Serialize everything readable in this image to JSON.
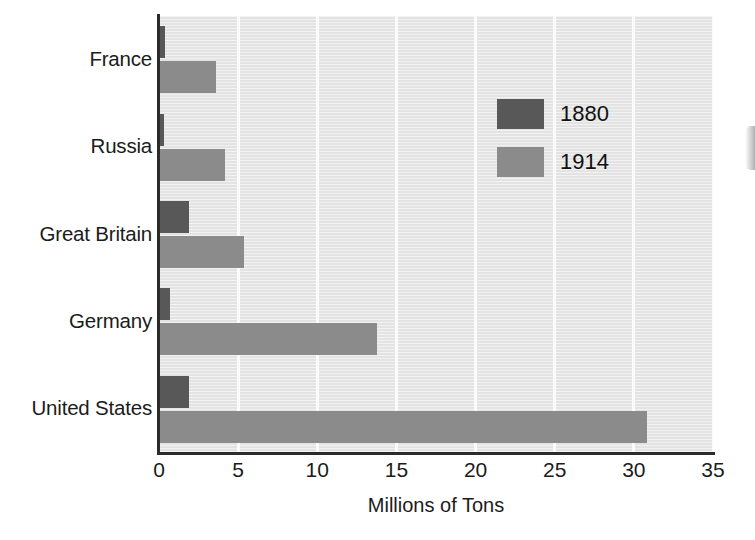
{
  "chart_data": {
    "type": "bar",
    "orientation": "horizontal",
    "title": "",
    "xlabel": "Millions of Tons",
    "ylabel": "",
    "categories": [
      "France",
      "Russia",
      "Great Britain",
      "Germany",
      "United States"
    ],
    "series": [
      {
        "name": "1880",
        "color": "#585858",
        "values": [
          0.4,
          0.3,
          1.9,
          0.7,
          1.9
        ]
      },
      {
        "name": "1914",
        "color": "#8b8b8b",
        "values": [
          3.6,
          4.2,
          5.4,
          13.8,
          30.8
        ]
      }
    ],
    "xlim": [
      0,
      35
    ],
    "xticks": [
      0,
      5,
      10,
      15,
      20,
      25,
      30,
      35
    ],
    "xtick_labels": [
      "0",
      "5",
      "10",
      "15",
      "20",
      "25",
      "30",
      "35"
    ],
    "grid": true,
    "grid_axis": "x",
    "legend_position": "upper right",
    "plot_background": "#e3e3e3",
    "gridline_color": "#fbfbfb",
    "axis_color": "#2b2b2b"
  },
  "legend": {
    "entries": [
      {
        "label": "1880",
        "color": "#585858"
      },
      {
        "label": "1914",
        "color": "#8b8b8b"
      }
    ]
  },
  "axis": {
    "x_title": "Millions of Tons"
  }
}
